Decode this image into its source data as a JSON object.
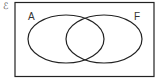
{
  "diagram": {
    "type": "venn",
    "universal_set_symbol": "ℰ",
    "sets": [
      {
        "label": "A"
      },
      {
        "label": "F"
      }
    ],
    "colors": {
      "stroke": "#222222",
      "background": "#ffffff"
    }
  }
}
